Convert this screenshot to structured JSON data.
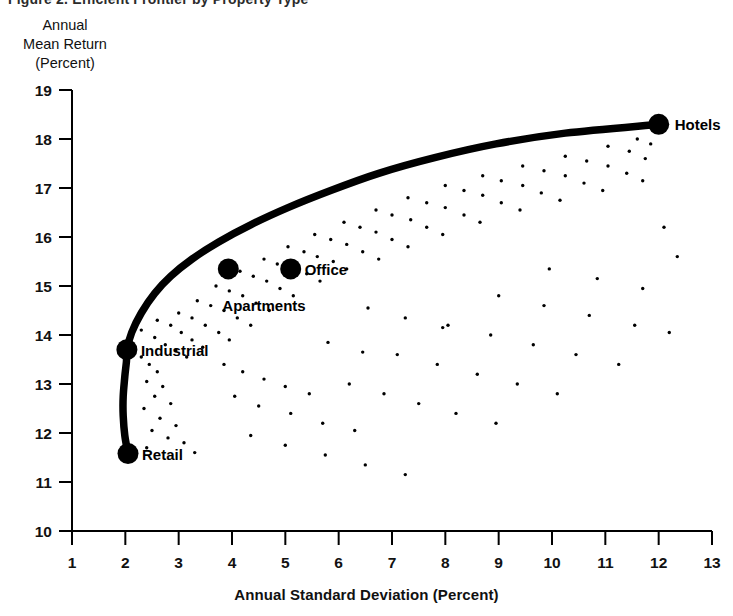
{
  "figure": {
    "title_remnant": "Figure 2.  Efficient Frontier by Property Type",
    "y_axis_title_lines": [
      "Annual",
      "Mean Return",
      "(Percent)"
    ],
    "x_axis_title": "Annual Standard Deviation (Percent)"
  },
  "chart_data": {
    "type": "scatter",
    "title": "",
    "xlabel": "Annual Standard Deviation (Percent)",
    "ylabel": "Annual Mean Return (Percent)",
    "xlim": [
      1,
      13
    ],
    "ylim": [
      10,
      19
    ],
    "xticks": [
      1,
      2,
      3,
      4,
      5,
      6,
      7,
      8,
      9,
      10,
      11,
      12,
      13
    ],
    "yticks": [
      10,
      11,
      12,
      13,
      14,
      15,
      16,
      17,
      18,
      19
    ],
    "xtick_labels": [
      "1",
      "2",
      "3",
      "4",
      "5",
      "6",
      "7",
      "8",
      "9",
      "10",
      "11",
      "12",
      "13"
    ],
    "ytick_labels": [
      "10",
      "11",
      "12",
      "13",
      "14",
      "15",
      "16",
      "17",
      "18",
      "19"
    ],
    "grid": false,
    "legend": "none",
    "series": [
      {
        "name": "Efficient Frontier",
        "type": "line",
        "style": "thick-black-curve",
        "points": [
          [
            2.05,
            11.58
          ],
          [
            1.99,
            11.95
          ],
          [
            1.96,
            12.35
          ],
          [
            1.96,
            12.75
          ],
          [
            1.99,
            13.15
          ],
          [
            2.02,
            13.45
          ],
          [
            2.03,
            13.7
          ],
          [
            2.12,
            14.05
          ],
          [
            2.3,
            14.45
          ],
          [
            2.55,
            14.85
          ],
          [
            2.85,
            15.2
          ],
          [
            3.25,
            15.55
          ],
          [
            3.75,
            15.9
          ],
          [
            4.35,
            16.25
          ],
          [
            5.05,
            16.6
          ],
          [
            5.85,
            16.95
          ],
          [
            6.75,
            17.3
          ],
          [
            7.8,
            17.62
          ],
          [
            8.95,
            17.9
          ],
          [
            10.25,
            18.12
          ],
          [
            12.0,
            18.3
          ]
        ]
      },
      {
        "name": "Property Types",
        "type": "scatter",
        "style": "large-black-dot",
        "labeled_points": [
          {
            "label": "Retail",
            "x": 2.05,
            "y": 11.58,
            "label_dx": 14,
            "label_dy": 6
          },
          {
            "label": "Industrial",
            "x": 2.03,
            "y": 13.7,
            "label_dx": 14,
            "label_dy": 6
          },
          {
            "label": "Apartments",
            "x": 3.93,
            "y": 15.35,
            "label_dx": -6,
            "label_dy": 42
          },
          {
            "label": "Office",
            "x": 5.1,
            "y": 15.35,
            "label_dx": 14,
            "label_dy": 6
          },
          {
            "label": "Hotels",
            "x": 12.0,
            "y": 18.3,
            "label_dx": 16,
            "label_dy": 6
          }
        ]
      },
      {
        "name": "Portfolio Cloud",
        "type": "scatter",
        "style": "tiny-black-dot",
        "points": [
          [
            2.3,
            13.55
          ],
          [
            2.45,
            13.4
          ],
          [
            2.6,
            13.25
          ],
          [
            2.4,
            13.05
          ],
          [
            2.7,
            12.95
          ],
          [
            2.55,
            12.75
          ],
          [
            2.85,
            12.6
          ],
          [
            2.35,
            12.5
          ],
          [
            2.65,
            12.3
          ],
          [
            2.95,
            12.15
          ],
          [
            2.5,
            12.05
          ],
          [
            2.8,
            11.9
          ],
          [
            3.1,
            11.8
          ],
          [
            2.4,
            11.7
          ],
          [
            3.3,
            11.6
          ],
          [
            2.3,
            14.1
          ],
          [
            2.55,
            13.95
          ],
          [
            2.75,
            13.8
          ],
          [
            2.95,
            13.7
          ],
          [
            3.15,
            13.55
          ],
          [
            2.6,
            14.3
          ],
          [
            2.85,
            14.2
          ],
          [
            3.05,
            14.05
          ],
          [
            3.25,
            13.9
          ],
          [
            3.45,
            13.75
          ],
          [
            3.0,
            14.45
          ],
          [
            3.25,
            14.35
          ],
          [
            3.5,
            14.2
          ],
          [
            3.75,
            14.05
          ],
          [
            3.95,
            13.9
          ],
          [
            3.35,
            14.7
          ],
          [
            3.6,
            14.6
          ],
          [
            3.85,
            14.5
          ],
          [
            4.1,
            14.35
          ],
          [
            4.35,
            14.2
          ],
          [
            3.7,
            15.0
          ],
          [
            3.95,
            14.9
          ],
          [
            4.2,
            14.8
          ],
          [
            4.45,
            14.65
          ],
          [
            4.7,
            14.5
          ],
          [
            4.15,
            15.3
          ],
          [
            4.4,
            15.2
          ],
          [
            4.65,
            15.1
          ],
          [
            4.9,
            14.95
          ],
          [
            5.15,
            14.8
          ],
          [
            4.6,
            15.55
          ],
          [
            4.85,
            15.45
          ],
          [
            5.1,
            15.35
          ],
          [
            5.4,
            15.25
          ],
          [
            5.65,
            15.1
          ],
          [
            5.05,
            15.8
          ],
          [
            5.35,
            15.7
          ],
          [
            5.6,
            15.6
          ],
          [
            5.9,
            15.5
          ],
          [
            6.15,
            15.35
          ],
          [
            5.55,
            16.05
          ],
          [
            5.85,
            15.95
          ],
          [
            6.15,
            15.85
          ],
          [
            6.45,
            15.7
          ],
          [
            6.75,
            15.55
          ],
          [
            6.1,
            16.3
          ],
          [
            6.4,
            16.2
          ],
          [
            6.7,
            16.1
          ],
          [
            7.0,
            15.95
          ],
          [
            7.3,
            15.8
          ],
          [
            6.7,
            16.55
          ],
          [
            7.0,
            16.45
          ],
          [
            7.35,
            16.35
          ],
          [
            7.65,
            16.2
          ],
          [
            7.95,
            16.05
          ],
          [
            7.3,
            16.8
          ],
          [
            7.65,
            16.7
          ],
          [
            8.0,
            16.6
          ],
          [
            8.35,
            16.45
          ],
          [
            8.65,
            16.3
          ],
          [
            8.0,
            17.05
          ],
          [
            8.35,
            16.95
          ],
          [
            8.7,
            16.85
          ],
          [
            9.05,
            16.7
          ],
          [
            9.4,
            16.55
          ],
          [
            8.7,
            17.25
          ],
          [
            9.05,
            17.15
          ],
          [
            9.45,
            17.05
          ],
          [
            9.8,
            16.9
          ],
          [
            10.15,
            16.75
          ],
          [
            9.45,
            17.45
          ],
          [
            9.85,
            17.35
          ],
          [
            10.25,
            17.25
          ],
          [
            10.6,
            17.1
          ],
          [
            10.95,
            16.95
          ],
          [
            10.25,
            17.65
          ],
          [
            10.65,
            17.55
          ],
          [
            11.05,
            17.45
          ],
          [
            11.4,
            17.3
          ],
          [
            11.7,
            17.15
          ],
          [
            11.05,
            17.85
          ],
          [
            11.45,
            17.75
          ],
          [
            11.75,
            17.6
          ],
          [
            11.6,
            18.0
          ],
          [
            11.85,
            17.9
          ],
          [
            3.85,
            13.4
          ],
          [
            4.2,
            13.25
          ],
          [
            4.6,
            13.1
          ],
          [
            5.0,
            12.95
          ],
          [
            5.45,
            12.8
          ],
          [
            4.05,
            12.75
          ],
          [
            4.5,
            12.55
          ],
          [
            5.1,
            12.4
          ],
          [
            5.7,
            12.2
          ],
          [
            6.3,
            12.05
          ],
          [
            4.35,
            11.95
          ],
          [
            5.0,
            11.75
          ],
          [
            5.75,
            11.55
          ],
          [
            6.5,
            11.35
          ],
          [
            7.25,
            11.15
          ],
          [
            6.2,
            13.0
          ],
          [
            6.85,
            12.8
          ],
          [
            7.5,
            12.6
          ],
          [
            8.2,
            12.4
          ],
          [
            8.95,
            12.2
          ],
          [
            7.1,
            13.6
          ],
          [
            7.85,
            13.4
          ],
          [
            8.6,
            13.2
          ],
          [
            9.35,
            13.0
          ],
          [
            10.1,
            12.8
          ],
          [
            8.05,
            14.2
          ],
          [
            8.85,
            14.0
          ],
          [
            9.65,
            13.8
          ],
          [
            10.45,
            13.6
          ],
          [
            11.25,
            13.4
          ],
          [
            9.0,
            14.8
          ],
          [
            9.85,
            14.6
          ],
          [
            10.7,
            14.4
          ],
          [
            11.55,
            14.2
          ],
          [
            12.2,
            14.05
          ],
          [
            9.95,
            15.35
          ],
          [
            10.85,
            15.15
          ],
          [
            11.7,
            14.95
          ],
          [
            12.35,
            15.6
          ],
          [
            12.1,
            16.2
          ],
          [
            6.55,
            14.55
          ],
          [
            7.25,
            14.35
          ],
          [
            7.95,
            14.15
          ],
          [
            5.8,
            13.85
          ],
          [
            6.45,
            13.65
          ]
        ]
      }
    ]
  }
}
